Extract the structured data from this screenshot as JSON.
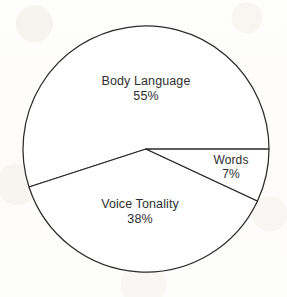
{
  "chart_data": {
    "type": "pie",
    "title": "",
    "subtitle": "",
    "xlabel": "",
    "ylabel": "",
    "legend_position": "none",
    "grid": false,
    "units": "percent",
    "total": 100,
    "start_angle_deg": 0,
    "direction": "clockwise",
    "categories": [
      "Body Language",
      "Voice Tonality",
      "Words"
    ],
    "values": [
      55,
      38,
      7
    ],
    "slices": [
      {
        "name": "Body Language",
        "value": 55,
        "value_label": "55%",
        "start_angle_deg": 162,
        "end_angle_deg": 360,
        "fill": "#ffffff",
        "stroke": "#2b2b2b",
        "label_x": 146,
        "label_y": 89
      },
      {
        "name": "Voice Tonality",
        "value": 38,
        "value_label": "38%",
        "start_angle_deg": 25,
        "end_angle_deg": 162,
        "fill": "#ffffff",
        "stroke": "#2b2b2b",
        "label_x": 140,
        "label_y": 212
      },
      {
        "name": "Words",
        "value": 7,
        "value_label": "7%",
        "start_angle_deg": 0,
        "end_angle_deg": 25,
        "fill": "#ffffff",
        "stroke": "#2b2b2b",
        "label_x": 231,
        "label_y": 167
      }
    ],
    "geometry": {
      "center_x": 146,
      "center_y": 149,
      "radius": 123,
      "stroke_width": 1.25
    },
    "colors": {
      "background": "#fdfdfb",
      "outline": "#2b2b2b",
      "slice_fill": "#ffffff",
      "text": "#2e2e2e"
    }
  }
}
